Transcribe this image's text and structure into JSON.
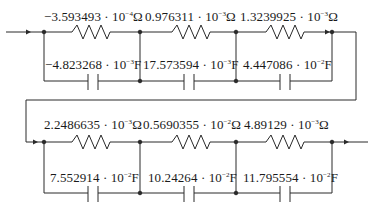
{
  "diagram": {
    "type": "RC ladder circuit (two cascaded stages)",
    "stroke_color": "#2a2a2a",
    "row1": {
      "resistors": [
        {
          "mantissa": "−3.593493",
          "exp": "−4",
          "unit": "Ω"
        },
        {
          "mantissa": "0.976311",
          "exp": "−3",
          "unit": "Ω"
        },
        {
          "mantissa": "1.3239925",
          "exp": "−3",
          "unit": "Ω"
        }
      ],
      "capacitors": [
        {
          "mantissa": "−4.823268",
          "exp": "−3",
          "unit": "F"
        },
        {
          "mantissa": "17.573594",
          "exp": "−3",
          "unit": "F"
        },
        {
          "mantissa": "4.447086",
          "exp": "−2",
          "unit": "F"
        }
      ]
    },
    "row2": {
      "resistors": [
        {
          "mantissa": "2.2486635",
          "exp": "−3",
          "unit": "Ω"
        },
        {
          "mantissa": "0.5690355",
          "exp": "−2",
          "unit": "Ω"
        },
        {
          "mantissa": "4.89129",
          "exp": "−3",
          "unit": "Ω"
        }
      ],
      "capacitors": [
        {
          "mantissa": "7.552914",
          "exp": "−2",
          "unit": "F"
        },
        {
          "mantissa": "10.24264",
          "exp": "−2",
          "unit": "F"
        },
        {
          "mantissa": "11.795554",
          "exp": "−2",
          "unit": "F"
        }
      ]
    },
    "dot": " · 10"
  }
}
